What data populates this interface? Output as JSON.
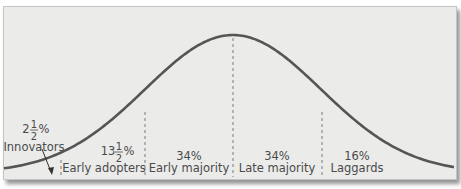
{
  "diagram": {
    "curve_type": "bell",
    "colors": {
      "background": "#ebebea",
      "curve": "#555555",
      "divider": "#7a7a7a",
      "text": "#4a4a4a",
      "border": "#c4c4c2"
    },
    "segments": [
      {
        "id": "innovators",
        "whole": "2",
        "fraction_num": "1",
        "fraction_den": "2",
        "percent_sign": "%",
        "label": "Innovators",
        "share": 2.5
      },
      {
        "id": "early-adopters",
        "whole": "13",
        "fraction_num": "1",
        "fraction_den": "2",
        "percent_sign": "%",
        "label": "Early adopters",
        "share": 13.5
      },
      {
        "id": "early-majority",
        "percent": "34%",
        "label": "Early majority",
        "share": 34
      },
      {
        "id": "late-majority",
        "percent": "34%",
        "label": "Late majority",
        "share": 34
      },
      {
        "id": "laggards",
        "percent": "16%",
        "label": "Laggards",
        "share": 16
      }
    ]
  }
}
